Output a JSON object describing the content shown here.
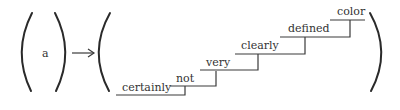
{
  "diagram": {
    "input_symbol": "a",
    "arrow": "right-arrow",
    "staircase_words": [
      "certainly",
      "not",
      "very",
      "clearly",
      "defined",
      "color"
    ],
    "colors": {
      "ink": "#333333"
    }
  }
}
